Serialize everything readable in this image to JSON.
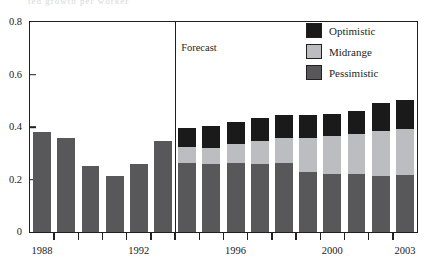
{
  "figure": {
    "top_remnant_text": "ted growth per worker",
    "forecast_label": "Forecast",
    "forecast_divider_after_year": 1993
  },
  "legend": {
    "position": "top-right",
    "items": [
      {
        "label": "Optimistic",
        "color": "#1a1a1a",
        "icon": "legend-swatch-icon"
      },
      {
        "label": "Midrange",
        "color": "#bcbdc0",
        "icon": "legend-swatch-icon"
      },
      {
        "label": "Pessimistic",
        "color": "#58585a",
        "icon": "legend-swatch-icon"
      }
    ]
  },
  "axes": {
    "y_ticks": [
      "0.8",
      "0.6",
      "0.4",
      "0.2",
      "0"
    ],
    "y_tick_values": [
      0.8,
      0.6,
      0.4,
      0.2,
      0
    ],
    "x_tick_labels": [
      "1988",
      "1992",
      "1996",
      "2000",
      "2003"
    ],
    "x_tick_label_years": [
      1988,
      1992,
      1996,
      2000,
      2003
    ]
  },
  "chart_data": {
    "type": "bar",
    "title": "",
    "subtitle": "",
    "xlabel": "",
    "ylabel": "",
    "ylim": [
      0,
      0.8
    ],
    "yticks": [
      0,
      0.2,
      0.4,
      0.6,
      0.8
    ],
    "grid": false,
    "stacked": true,
    "legend_position": "top-right",
    "categories": [
      "1988",
      "1989",
      "1990",
      "1991",
      "1992",
      "1993",
      "1994",
      "1995",
      "1996",
      "1997",
      "1998",
      "1999",
      "2000",
      "2001",
      "2002",
      "2003"
    ],
    "series": [
      {
        "name": "Pessimistic",
        "color": "#58585a",
        "values": [
          0.38,
          0.36,
          0.25,
          0.215,
          0.26,
          0.345,
          0.262,
          0.258,
          0.262,
          0.258,
          0.262,
          0.23,
          0.222,
          0.222,
          0.215,
          0.218
        ]
      },
      {
        "name": "Midrange",
        "color": "#bcbdc0",
        "values": [
          null,
          null,
          null,
          null,
          null,
          null,
          0.06,
          0.062,
          0.072,
          0.088,
          0.098,
          0.13,
          0.142,
          0.15,
          0.168,
          0.175
        ]
      },
      {
        "name": "Optimistic",
        "color": "#1a1a1a",
        "values": [
          null,
          null,
          null,
          null,
          null,
          null,
          0.073,
          0.085,
          0.086,
          0.089,
          0.085,
          0.085,
          0.086,
          0.088,
          0.107,
          0.11
        ]
      }
    ],
    "historical_series": {
      "name": "Historical",
      "color": "#58585a",
      "years": [
        1988,
        1989,
        1990,
        1991,
        1992,
        1993
      ],
      "values": [
        0.38,
        0.36,
        0.25,
        0.215,
        0.26,
        0.345
      ]
    },
    "totals": [
      0.38,
      0.36,
      0.25,
      0.215,
      0.26,
      0.345,
      0.395,
      0.405,
      0.42,
      0.435,
      0.445,
      0.445,
      0.45,
      0.46,
      0.49,
      0.503
    ],
    "annotations": [
      {
        "text": "Forecast",
        "x": 1994,
        "y": 0.7
      }
    ]
  }
}
